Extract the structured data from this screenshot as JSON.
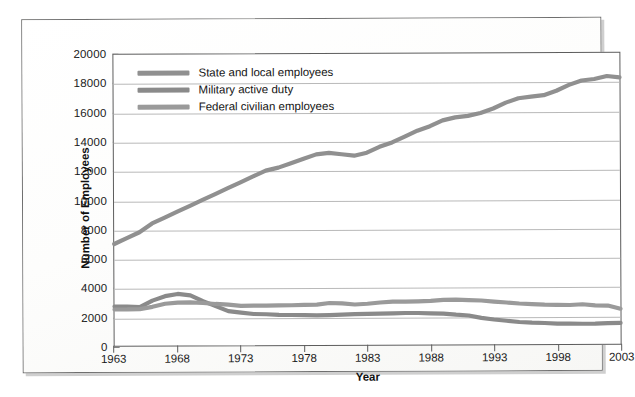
{
  "figure": {
    "axis_title_x": "Year",
    "axis_title_y": "Number of Employees"
  },
  "legend": {
    "items": [
      {
        "label": "State and local employees",
        "color": "#909090"
      },
      {
        "label": "Military active duty",
        "color": "#8a8a8a"
      },
      {
        "label": "Federal civilian employees",
        "color": "#9a9a9a"
      }
    ]
  },
  "chart_data": {
    "type": "line",
    "title": "",
    "xlabel": "Year",
    "ylabel": "Number of Employees",
    "xlim": [
      1963,
      2003
    ],
    "ylim": [
      0,
      20000
    ],
    "xticks": [
      1963,
      1968,
      1973,
      1978,
      1983,
      1988,
      1993,
      1998,
      2003
    ],
    "yticks": [
      0,
      2000,
      4000,
      6000,
      8000,
      10000,
      12000,
      14000,
      16000,
      18000,
      20000
    ],
    "grid": true,
    "legend_position": "top-left",
    "x": [
      1963,
      1964,
      1965,
      1966,
      1967,
      1968,
      1969,
      1970,
      1971,
      1972,
      1973,
      1974,
      1975,
      1976,
      1977,
      1978,
      1979,
      1980,
      1981,
      1982,
      1983,
      1984,
      1985,
      1986,
      1987,
      1988,
      1989,
      1990,
      1991,
      1992,
      1993,
      1994,
      1995,
      1996,
      1997,
      1998,
      1999,
      2000,
      2001,
      2002,
      2003
    ],
    "series": [
      {
        "name": "State and local employees",
        "color": "#909090",
        "values": [
          7000,
          7400,
          7800,
          8400,
          8800,
          9200,
          9600,
          10000,
          10400,
          10800,
          11200,
          11600,
          12000,
          12200,
          12500,
          12800,
          13100,
          13200,
          13100,
          13000,
          13200,
          13600,
          13900,
          14300,
          14700,
          15000,
          15400,
          15600,
          15700,
          15900,
          16200,
          16600,
          16900,
          17000,
          17100,
          17400,
          17800,
          18100,
          18200,
          18400,
          18300
        ]
      },
      {
        "name": "Military active duty",
        "color": "#8a8a8a",
        "values": [
          2700,
          2700,
          2650,
          3100,
          3400,
          3550,
          3450,
          3050,
          2700,
          2350,
          2250,
          2150,
          2130,
          2080,
          2070,
          2060,
          2030,
          2050,
          2080,
          2110,
          2120,
          2140,
          2150,
          2170,
          2170,
          2140,
          2120,
          2040,
          1980,
          1810,
          1700,
          1610,
          1520,
          1470,
          1440,
          1400,
          1390,
          1380,
          1380,
          1410,
          1430
        ]
      },
      {
        "name": "Federal civilian employees",
        "color": "#9a9a9a",
        "values": [
          2500,
          2500,
          2520,
          2670,
          2880,
          2950,
          2970,
          2920,
          2850,
          2800,
          2710,
          2720,
          2720,
          2730,
          2740,
          2760,
          2770,
          2880,
          2850,
          2770,
          2820,
          2900,
          2960,
          2950,
          2970,
          3000,
          3060,
          3080,
          3040,
          3010,
          2930,
          2860,
          2790,
          2740,
          2700,
          2690,
          2670,
          2720,
          2640,
          2620,
          2400
        ]
      }
    ]
  }
}
